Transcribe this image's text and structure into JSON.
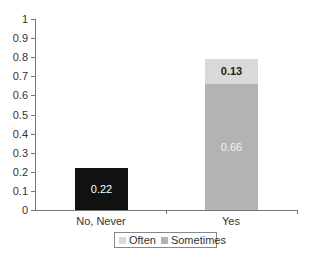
{
  "chart_data": {
    "type": "bar",
    "stacked": true,
    "title": "",
    "xlabel": "",
    "ylabel": "",
    "ylim": [
      0,
      1
    ],
    "yticks": [
      "0",
      "0.1",
      "0.2",
      "0.3",
      "0.4",
      "0.5",
      "0.6",
      "0.7",
      "0.8",
      "0.9",
      "1"
    ],
    "categories": [
      "No, Never",
      "Yes"
    ],
    "series": [
      {
        "name": "No, Never",
        "values": [
          0.22,
          null
        ],
        "color": "#111111"
      },
      {
        "name": "Sometimes",
        "values": [
          null,
          0.66
        ],
        "color": "#b3b3b3"
      },
      {
        "name": "Often",
        "values": [
          null,
          0.13
        ],
        "color": "#d9d9d9"
      }
    ],
    "data_labels": {
      "no_never": "0.22",
      "sometimes": "0.66",
      "often": "0.13"
    },
    "legend": {
      "position": "bottom",
      "entries": [
        "Often",
        "Sometimes"
      ]
    },
    "grid": false
  },
  "colors": {
    "no_never": "#111111",
    "sometimes": "#b3b3b3",
    "often": "#d9d9d9"
  }
}
